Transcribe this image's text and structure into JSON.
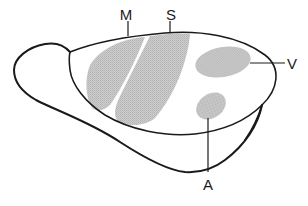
{
  "diagram": {
    "colors": {
      "outline": "#1a1a1a",
      "area_fill": "#c4c4c4",
      "background": "#ffffff"
    },
    "labels": {
      "motor": "M",
      "somatosensory": "S",
      "visual": "V",
      "auditory": "A"
    }
  }
}
